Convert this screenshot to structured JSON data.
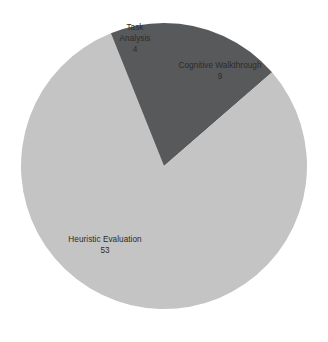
{
  "chart_data": {
    "type": "pie",
    "title": "",
    "subtitle": "",
    "xlabel": "",
    "ylabel": "",
    "legend": "none",
    "grid": false,
    "total": 66,
    "categories": [
      "Cognitive Walkthrough",
      "Heuristic Evaluation",
      "Task Analysis"
    ],
    "values": [
      9,
      53,
      4
    ],
    "slices": [
      {
        "label": "Cognitive Walkthrough",
        "value": "9",
        "value_number": 9,
        "percent": 13.6,
        "color": "#58595b",
        "start_angle_deg": 0,
        "end_angle_deg": 49.1
      },
      {
        "label": "Heuristic Evaluation",
        "value": "53",
        "value_number": 53,
        "percent": 80.3,
        "color": "#c4c4c4",
        "start_angle_deg": 49.1,
        "end_angle_deg": 338.2
      },
      {
        "label": "Task Analysis",
        "value": "4",
        "value_number": 4,
        "percent": 6.1,
        "color": "#58595b",
        "start_angle_deg": 338.2,
        "end_angle_deg": 360
      }
    ]
  },
  "colors": {
    "background": "#ffffff",
    "dark_slice": "#58595b",
    "light_slice": "#c4c4c4",
    "label_text": "#2b2b2b"
  },
  "geometry": {
    "center_x": 164,
    "center_y": 166,
    "radius": 143
  }
}
